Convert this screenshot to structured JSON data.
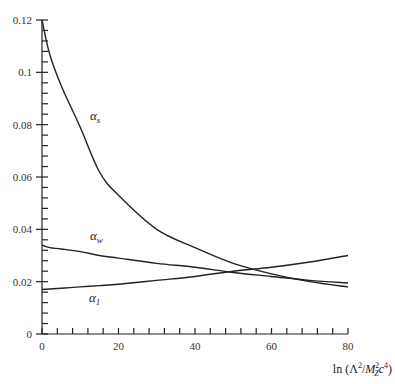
{
  "chart_data": {
    "type": "line",
    "title": "",
    "xlabel": "ln (Λ²/M_Z²c⁴)",
    "ylabel": "",
    "xlim": [
      0,
      80
    ],
    "ylim": [
      0,
      0.12
    ],
    "x_ticks": [
      "0",
      "20",
      "40",
      "60",
      "80"
    ],
    "y_ticks": [
      "0",
      "0.02",
      "0.04",
      "0.06",
      "0.08",
      "0.1",
      "0.12"
    ],
    "grid": false,
    "legend": "inline labels",
    "x": [
      0,
      2,
      5,
      10,
      15,
      20,
      30,
      40,
      50,
      60,
      70,
      80
    ],
    "series": [
      {
        "name": "α_s",
        "label_main": "α",
        "label_sub": "s",
        "values": [
          0.12,
          0.107,
          0.095,
          0.079,
          0.062,
          0.053,
          0.04,
          0.033,
          0.027,
          0.023,
          0.02,
          0.018
        ]
      },
      {
        "name": "α_w",
        "label_main": "α",
        "label_sub": "w",
        "values": [
          0.034,
          0.033,
          0.0325,
          0.0315,
          0.03,
          0.029,
          0.027,
          0.0255,
          0.0235,
          0.022,
          0.0205,
          0.0195
        ]
      },
      {
        "name": "α_1",
        "label_main": "α",
        "label_sub": "1",
        "values": [
          0.017,
          0.0172,
          0.0175,
          0.018,
          0.0185,
          0.019,
          0.0205,
          0.022,
          0.024,
          0.0255,
          0.0275,
          0.03
        ]
      }
    ]
  }
}
